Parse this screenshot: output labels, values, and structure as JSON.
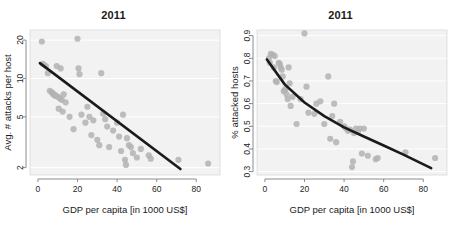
{
  "figure": {
    "background_color": "#ffffff",
    "panel_background_color": "#f2f2f2",
    "gridline_color": "#ffffff",
    "point_color": "#b3b3b3",
    "fit_line_color": "#1a1a1a",
    "axis_color": "#808080"
  },
  "chart_data": [
    {
      "type": "scatter",
      "panel": "left",
      "title": "2011",
      "xlabel": "GDP per capita [in 1000 US$]",
      "ylabel": "Avg. # attacks per host",
      "xlim": [
        -4,
        92
      ],
      "ylim": [
        1.75,
        24
      ],
      "yscale": "log",
      "xscale": "linear",
      "grid": true,
      "grid_axis": "y",
      "legend": "none",
      "xticks": [
        0,
        20,
        40,
        60,
        80
      ],
      "xticklabels": [
        "0",
        "20",
        "40",
        "60",
        "80"
      ],
      "yticks": [
        2,
        5,
        10,
        20
      ],
      "yticklabels": [
        "2",
        "5",
        "10",
        "20"
      ],
      "series": [
        {
          "name": "Countries",
          "marker": "circle",
          "color": "#b3b3b3",
          "x": [
            2.0,
            2.5,
            4.0,
            5.0,
            6.0,
            7.0,
            7.5,
            8.0,
            8.5,
            9.0,
            9.5,
            10.0,
            10.5,
            11.0,
            11.5,
            12.0,
            12.5,
            13.0,
            14.0,
            16.0,
            18.0,
            20.0,
            20.5,
            21.0,
            22.0,
            24.0,
            25.0,
            26.0,
            27.0,
            28.0,
            30.0,
            31.0,
            32.0,
            33.0,
            34.0,
            35.0,
            36.0,
            38.0,
            40.0,
            41.0,
            42.0,
            43.0,
            44.0,
            44.5,
            45.0,
            46.0,
            47.0,
            48.0,
            50.0,
            52.0,
            56.0,
            57.0,
            71.0,
            86.0
          ],
          "y": [
            19.5,
            13.0,
            12.5,
            11.0,
            8.0,
            7.8,
            7.6,
            7.5,
            7.4,
            7.3,
            12.5,
            7.2,
            5.8,
            7.0,
            12.0,
            6.8,
            5.5,
            7.5,
            6.5,
            5.0,
            4.0,
            20.5,
            12.0,
            10.8,
            5.2,
            4.5,
            6.0,
            5.0,
            3.6,
            4.7,
            3.3,
            3.0,
            11.0,
            5.3,
            4.8,
            4.2,
            2.9,
            3.9,
            4.5,
            3.5,
            2.7,
            5.2,
            2.3,
            2.1,
            3.4,
            3.0,
            2.9,
            2.6,
            2.4,
            2.8,
            2.5,
            2.35,
            2.3,
            2.15
          ]
        }
      ],
      "fit": {
        "name": "log-linear fit",
        "type": "line",
        "color": "#1a1a1a",
        "x": [
          1.0,
          72.0
        ],
        "y": [
          13.2,
          1.95
        ]
      }
    },
    {
      "type": "scatter",
      "panel": "right",
      "title": "2011",
      "xlabel": "GDP per capita [in 1000 US$]",
      "ylabel": "% attacked hosts",
      "xlim": [
        -4,
        92
      ],
      "ylim": [
        0.285,
        0.925
      ],
      "yscale": "linear",
      "xscale": "linear",
      "grid": true,
      "grid_axis": "y",
      "legend": "none",
      "xticks": [
        0,
        20,
        40,
        60,
        80
      ],
      "xticklabels": [
        "0",
        "20",
        "40",
        "60",
        "80"
      ],
      "yticks": [
        0.3,
        0.4,
        0.5,
        0.6,
        0.7,
        0.8,
        0.9
      ],
      "yticklabels": [
        "0.3",
        "0.4",
        "0.5",
        "0.6",
        "0.7",
        "0.8",
        "0.9"
      ],
      "series": [
        {
          "name": "Countries",
          "marker": "circle",
          "color": "#b3b3b3",
          "x": [
            2.0,
            2.5,
            3.0,
            4.0,
            4.5,
            5.0,
            5.5,
            6.0,
            7.0,
            7.5,
            8.0,
            8.5,
            9.0,
            9.5,
            10.0,
            10.5,
            11.0,
            11.5,
            12.0,
            12.5,
            13.0,
            14.0,
            16.0,
            18.0,
            20.0,
            21.0,
            22.0,
            25.0,
            26.0,
            28.0,
            30.0,
            32.0,
            33.0,
            34.0,
            35.0,
            36.0,
            38.0,
            40.0,
            41.0,
            42.0,
            43.0,
            44.0,
            44.5,
            45.0,
            46.0,
            47.0,
            48.0,
            49.0,
            50.0,
            52.0,
            56.0,
            57.0,
            71.0,
            86.0
          ],
          "y": [
            0.8,
            0.78,
            0.82,
            0.815,
            0.76,
            0.81,
            0.7,
            0.695,
            0.78,
            0.775,
            0.76,
            0.75,
            0.72,
            0.655,
            0.66,
            0.665,
            0.64,
            0.62,
            0.76,
            0.69,
            0.59,
            0.63,
            0.51,
            0.62,
            0.91,
            0.675,
            0.56,
            0.555,
            0.6,
            0.61,
            0.51,
            0.72,
            0.445,
            0.545,
            0.6,
            0.43,
            0.52,
            0.5,
            0.49,
            0.48,
            0.485,
            0.32,
            0.345,
            0.47,
            0.49,
            0.475,
            0.49,
            0.38,
            0.49,
            0.37,
            0.355,
            0.36,
            0.385,
            0.36
          ]
        }
      ],
      "fit": {
        "name": "exponential decay fit",
        "type": "curve",
        "color": "#1a1a1a",
        "x": [
          1.0,
          10.0,
          20.0,
          30.0,
          40.0,
          50.0,
          60.0,
          70.0,
          84.0
        ],
        "y": [
          0.795,
          0.685,
          0.605,
          0.545,
          0.495,
          0.455,
          0.415,
          0.375,
          0.315
        ]
      }
    }
  ]
}
